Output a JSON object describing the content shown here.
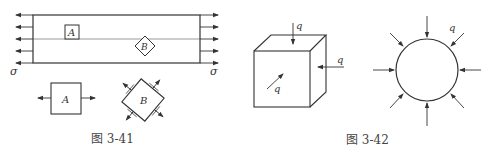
{
  "figures": [
    {
      "id": "fig-3-41",
      "caption": "图 3-41",
      "stress_label_left": "σ",
      "stress_label_right": "σ",
      "element_a_label": "A",
      "element_b_label": "B",
      "detail_a_label": "A",
      "detail_b_label": "B"
    },
    {
      "id": "fig-3-42",
      "caption": "图 3-42",
      "cube_load_top": "q",
      "cube_load_right": "q",
      "cube_load_front": "q",
      "circle_load": "q"
    }
  ],
  "colors": {
    "line": "#333333",
    "text": "#333333",
    "background": "#ffffff"
  }
}
